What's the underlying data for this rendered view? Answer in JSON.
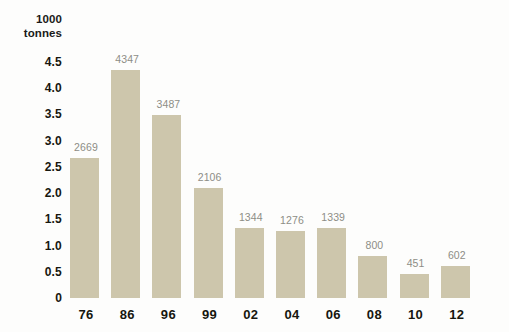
{
  "chart_data": {
    "type": "bar",
    "title": "",
    "subtitle": "",
    "xlabel": "",
    "ylabel": "1000 tonnes",
    "unit_header_line1": "1000",
    "unit_header_line2": "tonnes",
    "categories": [
      "76",
      "86",
      "96",
      "99",
      "02",
      "04",
      "06",
      "08",
      "10",
      "12"
    ],
    "values": [
      2669,
      4347,
      3487,
      2106,
      1344,
      1276,
      1339,
      800,
      451,
      602
    ],
    "value_labels": [
      "2669",
      "4347",
      "3487",
      "2106",
      "1344",
      "1276",
      "1339",
      "800",
      "451",
      "602"
    ],
    "y_tick_labels": [
      "4.5",
      "4.0",
      "3.5",
      "3.0",
      "2.5",
      "2.0",
      "1.5",
      "1.0",
      "0.5",
      "0"
    ],
    "y_tick_values": [
      4.5,
      4.0,
      3.5,
      3.0,
      2.5,
      2.0,
      1.5,
      1.0,
      0.5,
      0
    ],
    "ylim": [
      0,
      4.5
    ],
    "value_scale_divisor": 1000,
    "grid": false,
    "axis_lines": false,
    "legend": null,
    "legend_position": "none",
    "colors": {
      "bar_fill": "#cdc6ac",
      "background": "#fdfdfc",
      "value_label": "#8d8d86",
      "axis_label": "#16160e",
      "unit_header": "#1a1a18"
    }
  }
}
